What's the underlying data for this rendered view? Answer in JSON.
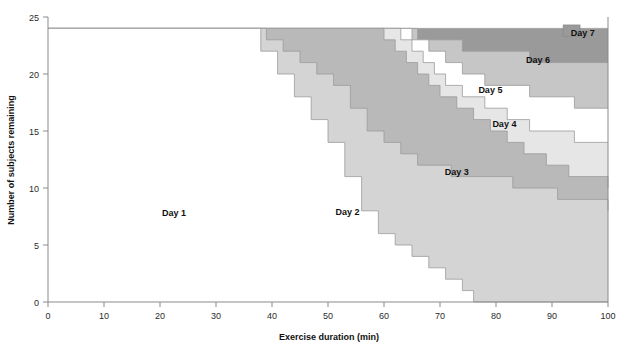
{
  "chart_data": {
    "type": "area",
    "title": "",
    "xlabel": "Exercise duration (min)",
    "ylabel": "Number of subjects remaining",
    "xlim": [
      0,
      100
    ],
    "ylim": [
      0,
      25
    ],
    "xticks": [
      0,
      10,
      20,
      30,
      40,
      50,
      60,
      70,
      80,
      90,
      100
    ],
    "yticks": [
      0,
      5,
      10,
      15,
      20,
      25
    ],
    "grid": false,
    "legend_position": "inside-annotations",
    "n_start": 24,
    "series": [
      {
        "name": "Day 1",
        "color": "#ffffff",
        "label_x": 22.5,
        "label_y": 7.8,
        "x": [
          0,
          35,
          38,
          41,
          44,
          47,
          50,
          53,
          56,
          59,
          62,
          65,
          68,
          71,
          74,
          76,
          100
        ],
        "values": [
          24,
          24,
          22,
          20,
          18,
          16,
          14,
          11,
          8,
          6,
          5,
          4,
          3,
          2,
          1,
          0,
          0
        ]
      },
      {
        "name": "Day 2",
        "color": "#d4d4d4",
        "label_x": 53.5,
        "label_y": 7.9,
        "x": [
          0,
          35,
          39,
          42,
          45,
          48,
          51,
          54,
          57,
          60,
          63,
          66,
          69,
          72,
          75,
          79,
          83,
          87,
          91,
          95,
          100
        ],
        "values": [
          24,
          24,
          23,
          22,
          21,
          20,
          19,
          17,
          15,
          14,
          13,
          12,
          12,
          11,
          11,
          11,
          10,
          10,
          9,
          9,
          8
        ]
      },
      {
        "name": "Day 3",
        "color": "#b9b9b9",
        "label_x": 73.0,
        "label_y": 11.4,
        "x": [
          0,
          57,
          60,
          62,
          64,
          66,
          68,
          70,
          73,
          76,
          79,
          82,
          85,
          89,
          93,
          97,
          100
        ],
        "values": [
          24,
          24,
          23,
          22,
          21,
          20,
          19,
          18,
          17,
          16,
          15,
          14,
          13,
          12,
          11,
          11,
          10
        ]
      },
      {
        "name": "Day 4",
        "color": "#e6e6e6",
        "label_x": 81.5,
        "label_y": 15.6,
        "x": [
          0,
          60,
          63,
          65,
          67,
          69,
          71,
          74,
          78,
          82,
          86,
          90,
          94,
          97,
          100
        ],
        "values": [
          24,
          24,
          23,
          22,
          21,
          20,
          19,
          18,
          17,
          16,
          15,
          15,
          14,
          14,
          14
        ]
      },
      {
        "name": "Day 5",
        "color": "#ffffff",
        "label_x": 79.0,
        "label_y": 18.6,
        "x": [
          0,
          62,
          65,
          68,
          71,
          74,
          78,
          82,
          86,
          90,
          94,
          100
        ],
        "values": [
          24,
          24,
          23,
          22,
          21,
          20,
          19,
          19,
          18,
          18,
          17,
          17
        ]
      },
      {
        "name": "Day 6",
        "color": "#c6c6c6",
        "label_x": 87.5,
        "label_y": 21.2,
        "x": [
          0,
          63,
          66,
          70,
          74,
          78,
          82,
          86,
          90,
          94,
          100
        ],
        "values": [
          24,
          24,
          23,
          23,
          22,
          22,
          22,
          21,
          21,
          21,
          21
        ]
      },
      {
        "name": "Day 7",
        "color": "#9a9a9a",
        "label_x": 95.5,
        "label_y": 23.6,
        "x": [
          0,
          92,
          94,
          100
        ],
        "values": [
          24,
          24,
          24,
          24
        ]
      }
    ]
  },
  "axes": {
    "x_tick_labels": [
      "0",
      "10",
      "20",
      "30",
      "40",
      "50",
      "60",
      "70",
      "80",
      "90",
      "100"
    ],
    "y_tick_labels": [
      "0",
      "5",
      "10",
      "15",
      "20",
      "25"
    ],
    "x_axis_title": "Exercise duration (min)",
    "y_axis_title": "Number of subjects remaining"
  }
}
